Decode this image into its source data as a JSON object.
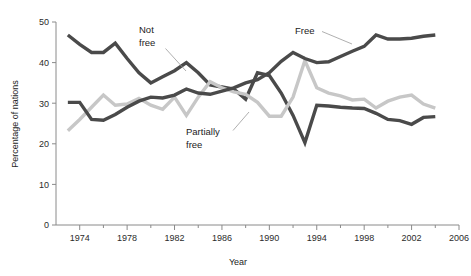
{
  "chart_data": {
    "type": "line",
    "title": "",
    "xlabel": "Year",
    "ylabel": "Percentage of nations",
    "xlim": [
      1972,
      2006
    ],
    "ylim": [
      0,
      50
    ],
    "xticks": [
      1974,
      1978,
      1982,
      1986,
      1990,
      1994,
      1998,
      2002,
      2006
    ],
    "xtick_labels": [
      "1974",
      "1978",
      "1982",
      "1986",
      "1990",
      "1994",
      "1998",
      "2002",
      "2006"
    ],
    "yticks": [
      0,
      10,
      20,
      30,
      40,
      50
    ],
    "ytick_labels": [
      "0",
      "10",
      "20",
      "30",
      "40",
      "50"
    ],
    "grid": false,
    "legend_position": "inline-annotations",
    "x": [
      1973,
      1974,
      1975,
      1976,
      1977,
      1978,
      1979,
      1980,
      1981,
      1982,
      1983,
      1984,
      1985,
      1986,
      1987,
      1988,
      1989,
      1990,
      1991,
      1992,
      1993,
      1994,
      1995,
      1996,
      1997,
      1998,
      1999,
      2000,
      2001,
      2002,
      2003,
      2004
    ],
    "series": [
      {
        "name": "Not free",
        "color": "#4a4a4a",
        "values": [
          46.8,
          44.5,
          42.5,
          42.5,
          44.8,
          41.0,
          37.5,
          35.0,
          36.5,
          38.0,
          40.0,
          37.5,
          34.5,
          34.0,
          33.5,
          31.0,
          37.5,
          36.8,
          32.5,
          27.0,
          20.3,
          29.5,
          29.3,
          29.0,
          28.8,
          28.7,
          27.5,
          26.0,
          25.7,
          24.8,
          26.5,
          26.7
        ]
      },
      {
        "name": "Partially free",
        "color": "#c7c7c7",
        "values": [
          23.2,
          26.0,
          29.0,
          32.0,
          29.5,
          29.8,
          31.2,
          29.5,
          28.5,
          31.5,
          27.0,
          31.5,
          35.3,
          33.8,
          32.8,
          32.2,
          30.2,
          26.8,
          26.8,
          31.5,
          40.5,
          33.8,
          32.5,
          31.8,
          30.8,
          31.0,
          28.8,
          30.5,
          31.5,
          32.0,
          29.8,
          28.8
        ]
      },
      {
        "name": "Free",
        "color": "#4a4a4a",
        "values": [
          30.2,
          30.2,
          26.0,
          25.8,
          27.2,
          29.0,
          30.5,
          31.5,
          31.3,
          32.0,
          33.5,
          32.5,
          32.2,
          33.0,
          33.8,
          35.0,
          35.8,
          37.5,
          40.3,
          42.5,
          41.0,
          40.0,
          40.2,
          41.5,
          42.8,
          44.0,
          46.8,
          45.8,
          45.8,
          46.0,
          46.5,
          46.8
        ]
      }
    ],
    "annotations": [
      {
        "text_line1": "Not",
        "text_line2": "free",
        "target_series": "Not free"
      },
      {
        "text_line1": "Partially",
        "text_line2": "free",
        "target_series": "Partially free"
      },
      {
        "text_line1": "Free",
        "text_line2": "",
        "target_series": "Free"
      }
    ]
  },
  "axes": {
    "y_title": "Percentage of nations",
    "x_title": "Year"
  },
  "labels": {
    "not_free_l1": "Not",
    "not_free_l2": "free",
    "partially_free_l1": "Partially",
    "partially_free_l2": "free",
    "free_l1": "Free"
  },
  "colors": {
    "dark_line": "#4a4a4a",
    "light_line": "#c7c7c7",
    "axis": "#8a8a8a",
    "text": "#1c1c1c",
    "background": "#ffffff"
  }
}
